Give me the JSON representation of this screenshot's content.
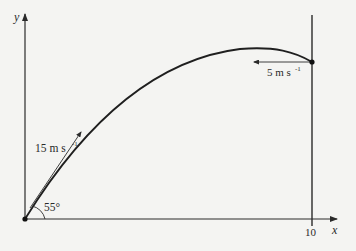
{
  "diagram": {
    "type": "projectile-motion",
    "axes": {
      "x_label": "x",
      "y_label": "y",
      "x_tick_label": "10"
    },
    "launch": {
      "speed_label": "15 m s",
      "speed_unit_exp": "-1",
      "angle_label": "55°"
    },
    "impact": {
      "speed_label": "5 m s",
      "speed_unit_exp": "-1"
    },
    "colors": {
      "background": "#f4f4f2",
      "ink": "#2a2a2a"
    }
  }
}
